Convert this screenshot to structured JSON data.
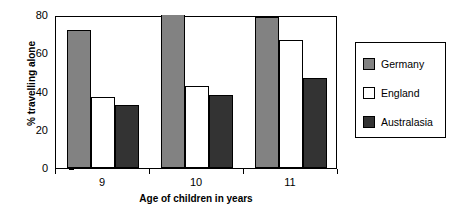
{
  "chart_data": {
    "type": "bar",
    "title": "",
    "subtitle": "",
    "xlabel": "Age of children in years",
    "ylabel": "% travelling alone",
    "categories": [
      "9",
      "10",
      "11"
    ],
    "series": [
      {
        "name": "Germany",
        "color": "#828282",
        "values": [
          72,
          80,
          79
        ]
      },
      {
        "name": "England",
        "color": "#ffffff",
        "values": [
          37,
          43,
          67
        ]
      },
      {
        "name": "Australasia",
        "color": "#333333",
        "values": [
          33,
          38,
          47
        ]
      }
    ],
    "ylim": [
      0,
      80
    ],
    "yticks": [
      0,
      20,
      40,
      60,
      80
    ],
    "ytick_labels": [
      "0",
      "20",
      "40",
      "60",
      "80"
    ],
    "grid": false,
    "legend_position": "right",
    "bar_border_color": "#000000",
    "axis_color": "#000000",
    "background": "#ffffff"
  },
  "legend": {
    "entries": [
      {
        "label": "Germany"
      },
      {
        "label": "England"
      },
      {
        "label": "Australasia"
      }
    ]
  }
}
